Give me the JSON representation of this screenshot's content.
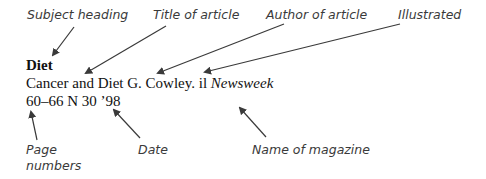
{
  "labels": {
    "subject_heading": "Subject heading",
    "title_of_article": "Title of article",
    "author_of_article": "Author of article",
    "illustrated": "Illustrated",
    "page_numbers_line1": "Page",
    "page_numbers_line2": "numbers",
    "date": "Date",
    "name_of_magazine": "Name of magazine"
  },
  "entry": {
    "subject": "Diet",
    "title": "Cancer and Diet",
    "author": "G. Cowley.",
    "illustrated_abbrev": "il",
    "magazine": "Newsweek",
    "pages": "60–66",
    "date": "N 30 ’98"
  },
  "colors": {
    "arrow": "#3a3a3a",
    "label_text": "#3a3a3a",
    "entry_text": "#111111"
  }
}
